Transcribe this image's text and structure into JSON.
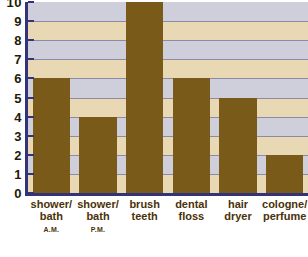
{
  "chart_data": {
    "type": "bar",
    "title": "",
    "xlabel": "",
    "ylabel": "",
    "ylim": [
      0,
      10
    ],
    "grid": true,
    "legend": "none",
    "categories": [
      "shower/ bath A.M.",
      "shower/ bath P.M.",
      "brush teeth",
      "dental floss",
      "hair dryer",
      "cologne/ perfume"
    ],
    "values": [
      6,
      4,
      10,
      6,
      5,
      2
    ],
    "ytick_labels": [
      "10",
      "9",
      "8",
      "7",
      "6",
      "5",
      "4",
      "3",
      "2",
      "1",
      "0"
    ],
    "yticks": [
      10,
      9,
      8,
      7,
      6,
      5,
      4,
      3,
      2,
      1,
      0
    ],
    "bar_color": "#7a5a18",
    "axis_color": "#33337a",
    "band_colors": [
      "#cfcfdc",
      "#e8d8b4"
    ],
    "gridline_color": "#8d8aa6",
    "label_color": "#4a3208"
  },
  "axis": {
    "y_labels": [
      {
        "text": "10",
        "value": 10
      },
      {
        "text": "9",
        "value": 9
      },
      {
        "text": "8",
        "value": 8
      },
      {
        "text": "7",
        "value": 7
      },
      {
        "text": "6",
        "value": 6
      },
      {
        "text": "5",
        "value": 5
      },
      {
        "text": "4",
        "value": 4
      },
      {
        "text": "3",
        "value": 3
      },
      {
        "text": "2",
        "value": 2
      },
      {
        "text": "1",
        "value": 1
      },
      {
        "text": "0",
        "value": 0
      }
    ]
  },
  "categories_display": [
    {
      "line1": "shower/",
      "line2": "bath",
      "line3": "A.M.",
      "value": 6
    },
    {
      "line1": "shower/",
      "line2": "bath",
      "line3": "P.M.",
      "value": 4
    },
    {
      "line1": "brush",
      "line2": "teeth",
      "line3": "",
      "value": 10
    },
    {
      "line1": "dental",
      "line2": "floss",
      "line3": "",
      "value": 6
    },
    {
      "line1": "hair",
      "line2": "dryer",
      "line3": "",
      "value": 5
    },
    {
      "line1": "cologne/",
      "line2": "perfume",
      "line3": "",
      "value": 2
    }
  ]
}
